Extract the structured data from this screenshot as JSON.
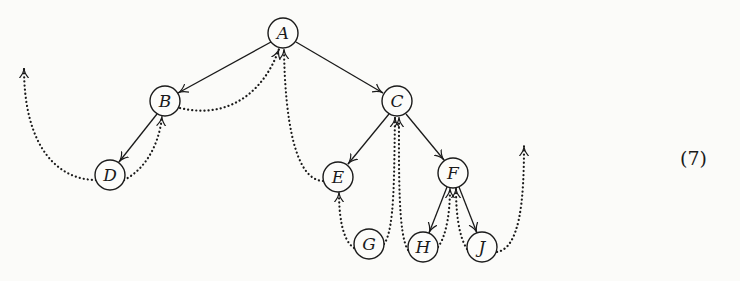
{
  "figure": {
    "type": "threaded binary tree",
    "equation_number": "(7)",
    "nodes": [
      {
        "id": "A",
        "label": "A",
        "x": 283,
        "y": 33
      },
      {
        "id": "B",
        "label": "B",
        "x": 165,
        "y": 101
      },
      {
        "id": "C",
        "label": "C",
        "x": 397,
        "y": 101
      },
      {
        "id": "D",
        "label": "D",
        "x": 110,
        "y": 175
      },
      {
        "id": "E",
        "label": "E",
        "x": 338,
        "y": 177
      },
      {
        "id": "F",
        "label": "F",
        "x": 453,
        "y": 173
      },
      {
        "id": "G",
        "label": "G",
        "x": 369,
        "y": 244
      },
      {
        "id": "H",
        "label": "H",
        "x": 423,
        "y": 247
      },
      {
        "id": "J",
        "label": "J",
        "x": 482,
        "y": 247
      }
    ],
    "links": [
      {
        "from": "A",
        "to": "B",
        "style": "solid"
      },
      {
        "from": "A",
        "to": "C",
        "style": "solid"
      },
      {
        "from": "B",
        "to": "D",
        "style": "solid"
      },
      {
        "from": "C",
        "to": "E",
        "style": "solid"
      },
      {
        "from": "C",
        "to": "F",
        "style": "solid"
      },
      {
        "from": "F",
        "to": "H",
        "style": "solid"
      },
      {
        "from": "F",
        "to": "J",
        "style": "solid"
      }
    ],
    "threads": [
      {
        "from": "D",
        "to": "head (left)",
        "style": "dotted"
      },
      {
        "from": "D",
        "to": "B",
        "style": "dotted"
      },
      {
        "from": "B",
        "to": "A",
        "style": "dotted"
      },
      {
        "from": "E",
        "to": "A",
        "style": "dotted"
      },
      {
        "from": "G",
        "to": "E",
        "style": "dotted"
      },
      {
        "from": "G",
        "to": "C",
        "style": "dotted"
      },
      {
        "from": "H",
        "to": "C",
        "style": "dotted"
      },
      {
        "from": "H",
        "to": "F",
        "style": "dotted"
      },
      {
        "from": "J",
        "to": "F",
        "style": "dotted"
      },
      {
        "from": "J",
        "to": "head (right)",
        "style": "dotted"
      }
    ]
  }
}
